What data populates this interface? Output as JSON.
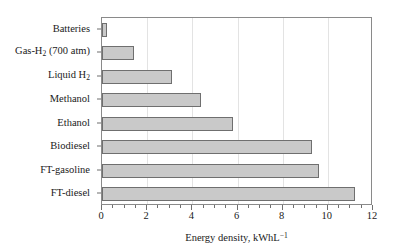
{
  "chart_data": {
    "type": "bar",
    "orientation": "horizontal",
    "title": "",
    "xlabel": "Energy density, kWhL⁻¹",
    "ylabel": "",
    "xlim": [
      0,
      12
    ],
    "xticks": [
      0,
      2,
      4,
      6,
      8,
      10,
      12
    ],
    "xtick_labels": [
      "0",
      "2",
      "4",
      "6",
      "8",
      "10",
      "12"
    ],
    "minor_tick_step": 0.5,
    "grid": "vertical-major",
    "legend": "none",
    "categories": [
      "Batteries",
      "Gas-H2 (700 atm)",
      "Liquid H2",
      "Methanol",
      "Ethanol",
      "Biodiesel",
      "FT-gasoline",
      "FT-diesel"
    ],
    "category_labels_html": [
      "Batteries",
      "Gas-H<sub>2</sub> (700 atm)",
      "Liquid H<sub>2</sub>",
      "Methanol",
      "Ethanol",
      "Biodiesel",
      "FT-gasoline",
      "FT-diesel"
    ],
    "values": [
      0.2,
      1.4,
      3.1,
      4.4,
      5.8,
      9.3,
      9.6,
      11.2
    ],
    "units": "kWh L^-1",
    "bar_fill_color": "#c9c9c9",
    "bar_edge_color": "#6f6f6f",
    "gridline_color": "#e3e3e3",
    "axis_color": "#8a8a8a",
    "background_color": "#ffffff"
  },
  "axis_title_html": "Energy density, kWhL<sup>−1</sup>"
}
